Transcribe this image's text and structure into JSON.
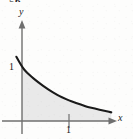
{
  "figure": {
    "number_partial": "56",
    "background_color": "#fdfdfc",
    "shade_color": "#e9e9e9",
    "curve_color": "#1a1a1a",
    "axis_color": "#6f6f6f",
    "label_color": "#1b1b1b"
  },
  "axes": {
    "x_label": "x",
    "y_label": "y",
    "x_tick_label": "1",
    "y_tick_label": "1"
  },
  "chart_data": {
    "type": "area",
    "title": "",
    "subtitle": "",
    "xlabel": "x",
    "ylabel": "y",
    "xlim": [
      -0.12,
      1.95
    ],
    "ylim": [
      0,
      1.55
    ],
    "grid": false,
    "legend": null,
    "xticks": [
      1
    ],
    "xticklabels": [
      "1"
    ],
    "yticks": [
      1
    ],
    "yticklabels": [
      "1"
    ],
    "annotations": [],
    "series": [
      {
        "name": "decaying exponential curve",
        "style": "solid",
        "color": "#1a1a1a",
        "filled_under": true,
        "fill_color": "#e9e9e9",
        "fill_domain": [
          0,
          1.9
        ],
        "x": [
          -0.12,
          0.0,
          0.1,
          0.2,
          0.3,
          0.4,
          0.5,
          0.6,
          0.7,
          0.8,
          0.9,
          1.0,
          1.1,
          1.2,
          1.3,
          1.4,
          1.5,
          1.6,
          1.7,
          1.8,
          1.9
        ],
        "y": [
          1.19,
          1.0,
          0.9,
          0.82,
          0.75,
          0.68,
          0.62,
          0.56,
          0.51,
          0.46,
          0.42,
          0.38,
          0.35,
          0.32,
          0.29,
          0.26,
          0.24,
          0.22,
          0.2,
          0.18,
          0.16
        ]
      }
    ]
  }
}
